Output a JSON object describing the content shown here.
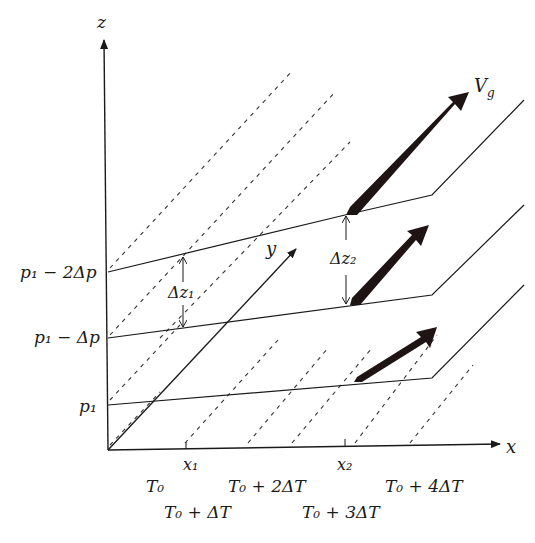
{
  "figure": {
    "axes": {
      "z_label": "z",
      "x_label": "x",
      "y_label": "y"
    },
    "pressure_levels": [
      {
        "label": "p₁",
        "id": "p1"
      },
      {
        "label": "p₁ − Δp",
        "id": "p1-dp"
      },
      {
        "label": "p₁ − 2Δp",
        "id": "p1-2dp"
      }
    ],
    "x_ticks": [
      {
        "label": "x₁"
      },
      {
        "label": "x₂"
      }
    ],
    "thickness_labels": {
      "dz1": "Δz₁",
      "dz2": "Δz₂"
    },
    "wind_label": "V_g",
    "isotherm_labels": [
      {
        "label": "T₀"
      },
      {
        "label": "T₀ + ΔT"
      },
      {
        "label": "T₀ + 2ΔT"
      },
      {
        "label": "T₀ + 3ΔT"
      },
      {
        "label": "T₀ + 4ΔT"
      }
    ],
    "colors": {
      "ink": "#1a1a1a",
      "background": "#ffffff",
      "arrow_fill": "#1e1414"
    }
  }
}
